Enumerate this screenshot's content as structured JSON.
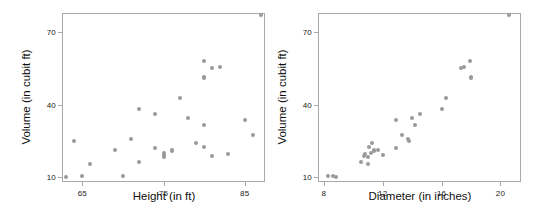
{
  "figure": {
    "background_color": "#ffffff",
    "point_color": "#9a9a9a",
    "frame_color": "#a9a9a9",
    "text_color": "#111111"
  },
  "chart_data": [
    {
      "type": "scatter",
      "title": "",
      "xlabel": "Height (in ft)",
      "ylabel": "Volume (in cubit ft)",
      "xlim": [
        62.5,
        87.5
      ],
      "ylim": [
        8.0,
        78.0
      ],
      "grid": false,
      "legend": "none",
      "xticks": [
        65,
        75,
        85
      ],
      "xticklabels": [
        "65",
        "75",
        "85"
      ],
      "yticks": [
        10,
        40,
        70
      ],
      "yticklabels": [
        "10",
        "40",
        "70"
      ],
      "x": [
        70,
        65,
        63,
        72,
        81,
        83,
        66,
        75,
        80,
        75,
        79,
        76,
        76,
        69,
        75,
        74,
        85,
        86,
        71,
        64,
        78,
        80,
        74,
        72,
        77,
        81,
        82,
        80,
        80,
        80,
        87
      ],
      "y": [
        10.3,
        10.3,
        10.2,
        16.4,
        18.8,
        19.7,
        15.6,
        18.2,
        22.6,
        19.9,
        24.2,
        21.0,
        21.4,
        21.3,
        19.1,
        22.2,
        33.8,
        27.4,
        25.7,
        24.9,
        34.5,
        31.7,
        36.3,
        38.3,
        42.6,
        55.4,
        55.7,
        58.3,
        51.5,
        51.0,
        77.0
      ]
    },
    {
      "type": "scatter",
      "title": "",
      "xlabel": "Diameter (in inches)",
      "ylabel": "Volume (in cubit ft)",
      "xlim": [
        7.6,
        21.4
      ],
      "ylim": [
        8.0,
        78.0
      ],
      "grid": false,
      "legend": "none",
      "xticks": [
        8,
        12,
        16,
        20
      ],
      "xticklabels": [
        "8",
        "12",
        "16",
        "20"
      ],
      "yticks": [
        10,
        40,
        70
      ],
      "yticklabels": [
        "10",
        "40",
        "70"
      ],
      "x": [
        8.3,
        8.6,
        8.8,
        10.5,
        10.7,
        10.8,
        11.0,
        11.0,
        11.1,
        11.2,
        11.3,
        11.4,
        11.4,
        11.7,
        12.0,
        12.9,
        12.9,
        13.3,
        13.7,
        13.8,
        14.0,
        14.2,
        14.5,
        16.0,
        16.3,
        17.3,
        17.5,
        17.9,
        18.0,
        18.0,
        20.6
      ],
      "y": [
        10.3,
        10.3,
        10.2,
        16.4,
        18.8,
        19.7,
        15.6,
        18.2,
        22.6,
        19.9,
        24.2,
        21.0,
        21.4,
        21.3,
        19.1,
        22.2,
        33.8,
        27.4,
        25.7,
        24.9,
        34.5,
        31.7,
        36.3,
        38.3,
        42.6,
        55.4,
        55.7,
        58.3,
        51.5,
        51.0,
        77.0
      ]
    }
  ],
  "panels": {
    "left": {
      "name": "height-vs-volume-scatter",
      "chart_index": 0,
      "frame": {
        "left": 62,
        "top": 13,
        "width": 203,
        "height": 169
      },
      "axis_title_x_pos": {
        "x": 164,
        "y": 190
      },
      "axis_title_y_pos": {
        "x": 20,
        "y": 97
      }
    },
    "right": {
      "name": "diameter-vs-volume-scatter",
      "chart_index": 1,
      "frame": {
        "left": 42,
        "top": 13,
        "width": 203,
        "height": 169
      },
      "axis_title_x_pos": {
        "x": 144,
        "y": 190
      },
      "axis_title_y_pos": {
        "x": 0,
        "y": 97
      }
    }
  }
}
